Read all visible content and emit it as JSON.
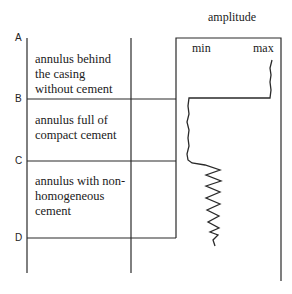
{
  "title": "amplitude",
  "axis": {
    "min_label": "min",
    "max_label": "max"
  },
  "markers": [
    "A",
    "B",
    "C",
    "D"
  ],
  "zones": [
    {
      "marker": "A",
      "text": "annulus  behind\nthe casing\nwithout cement"
    },
    {
      "marker": "B",
      "text": "annulus full of\ncompact cement"
    },
    {
      "marker": "C",
      "text": "annulus with non-\nhomogeneous\ncement"
    }
  ],
  "colors": {
    "line": "#2a2a2a",
    "background": "#ffffff"
  }
}
